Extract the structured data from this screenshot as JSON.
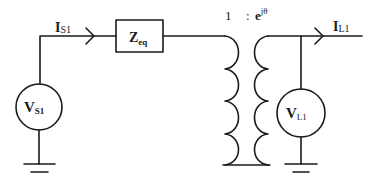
{
  "diagram": {
    "type": "circuit",
    "source": {
      "label_main": "V",
      "label_sub": "S1"
    },
    "source_current": {
      "label_main": "I",
      "label_sub": "S1"
    },
    "impedance": {
      "label_main": "Z",
      "label_sub": "eq"
    },
    "transformer": {
      "ratio_left": "1",
      "ratio_sep": ":",
      "ratio_right_main": "e",
      "ratio_right_sup": "jθ"
    },
    "load": {
      "label_main": "V",
      "label_sub": "L1"
    },
    "load_current": {
      "label_main": "I",
      "label_sub": "L1"
    },
    "colors": {
      "line": "#1a1a1a",
      "background": "#ffffff"
    }
  }
}
